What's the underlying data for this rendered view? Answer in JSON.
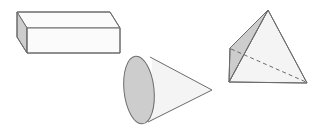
{
  "figure": {
    "width": 328,
    "height": 133,
    "background_color": "#ffffff",
    "stroke_color": "#6b6b6b",
    "stroke_width": 1,
    "fill_light": "#fbfbfb",
    "fill_front": "#f4f4f4",
    "fill_shaded": "#cdcdcd",
    "fill_shaded_mid": "#d6d6d6",
    "dash_pattern": "4,3"
  },
  "shapes": [
    {
      "id": "rectangular-prism",
      "name": "Rectangular prism",
      "label": "box",
      "faces": {
        "top": "17,12 110,12 120,28 27,28",
        "front": "27,28 120,28 120,53 27,53",
        "left": "17,12 27,28 27,53 17,37"
      },
      "edges": [
        "17,12 110,12",
        "110,12 120,28",
        "120,28 27,28",
        "27,28 17,12",
        "27,28 27,53",
        "27,53 120,53",
        "120,53 120,28",
        "17,12 17,37",
        "17,37 27,53"
      ]
    },
    {
      "id": "cone",
      "name": "Cone",
      "label": "cone",
      "base_ellipse": {
        "cx": 139,
        "cy": 90,
        "rx": 15,
        "ry": 35,
        "rotation": -6
      },
      "apex": {
        "x": 212,
        "y": 90
      },
      "body": "153,58 212,90 151,122",
      "edges": [
        "152,59 212,90",
        "212,90 150,121"
      ]
    },
    {
      "id": "triangular-pyramid",
      "name": "Triangular pyramid",
      "label": "pyramid",
      "vertices": {
        "apex": {
          "x": 268,
          "y": 10
        },
        "front_left": {
          "x": 229,
          "y": 82
        },
        "front_right": {
          "x": 307,
          "y": 83
        },
        "back_left": {
          "x": 230,
          "y": 48
        }
      },
      "faces": {
        "front": "268,10 229,82 307,83",
        "left_shaded": "268,10 230,48 229,82",
        "base_sliver": "230,48 229,82 307,83"
      },
      "edges": [
        "268,10 229,82",
        "268,10 307,83",
        "229,82 307,83",
        "268,10 230,48",
        "230,48 229,82"
      ],
      "hidden_edges": [
        "230,48 307,83"
      ]
    }
  ]
}
